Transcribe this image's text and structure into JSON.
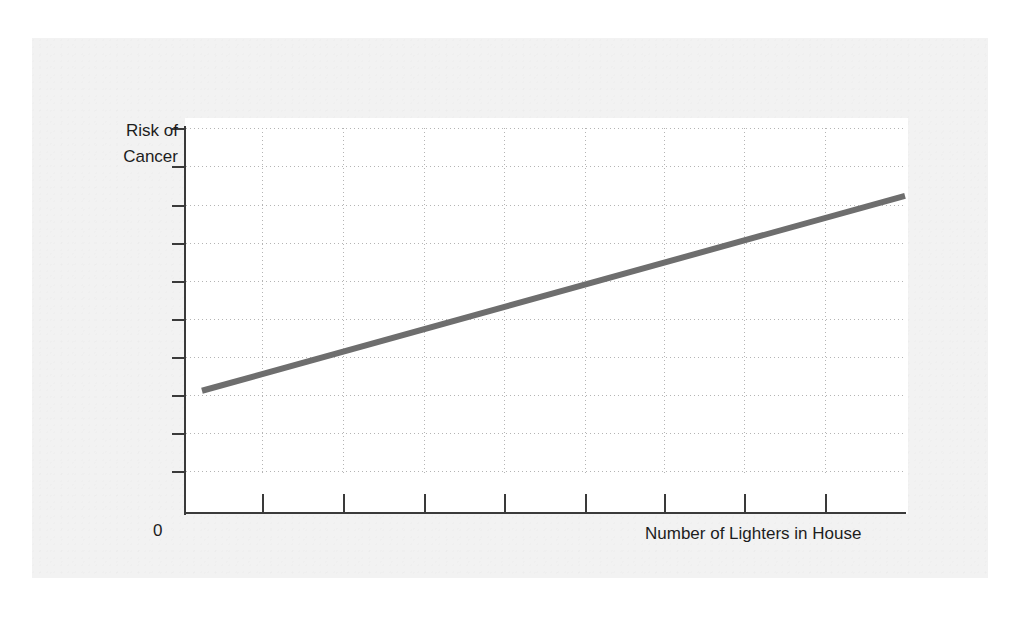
{
  "figure": {
    "origin_label": "0",
    "y_axis_title_line1": "Risk of",
    "y_axis_title_line2": "Cancer",
    "x_axis_title": "Number of Lighters in House",
    "colors": {
      "trend_line": "#6e6e6e",
      "axis": "#3a3a3a",
      "grid": "#b4b4b4",
      "panel_background": "#ffffff",
      "page_background": "#f2f2f2",
      "text": "#1d1d1d"
    }
  },
  "chart_data": {
    "type": "line",
    "title": "",
    "subtitle": "",
    "xlabel": "Number of Lighters in House",
    "ylabel": "Risk of Cancer",
    "x_tick_labels": [],
    "y_tick_labels": [],
    "origin_label": "0",
    "grid": true,
    "grid_style": "dotted",
    "legend": false,
    "legend_position": "none",
    "axis_ranges": {
      "xlim": [
        0,
        9
      ],
      "ylim": [
        0,
        10
      ]
    },
    "annotations": [],
    "series": [
      {
        "name": "Risk of Cancer trend",
        "style": "solid straight line, thick gray, no markers",
        "color": "#6e6e6e",
        "x": [
          0.2,
          9.0
        ],
        "y": [
          2.45,
          8.05
        ],
        "description": "Positive linear relationship: risk of cancer increases steadily with number of lighters in house"
      }
    ],
    "gridlines": {
      "horizontal_y_pixels": [
        128,
        166,
        205,
        243,
        281,
        319,
        357,
        395,
        433,
        471
      ],
      "vertical_x_pixels": [
        262,
        343,
        424,
        504,
        585,
        664,
        744,
        825
      ]
    }
  }
}
